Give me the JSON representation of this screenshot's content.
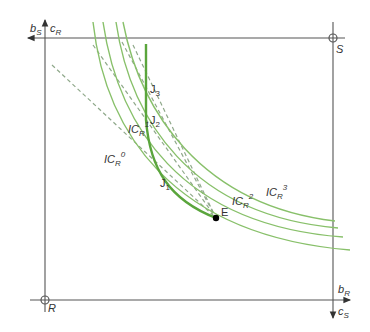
{
  "diagram": {
    "type": "edgeworth-box",
    "colors": {
      "axis": "#555555",
      "indifference_curve": "#88c06a",
      "contract_curve": "#5aa53c",
      "budget_line": "#8fa88a",
      "point": "#000000"
    },
    "origins": {
      "top_right": {
        "label": "S"
      },
      "bottom_left": {
        "label": "R"
      }
    },
    "axis_labels": {
      "top_left_horizontal": {
        "base": "b",
        "sub": "S"
      },
      "top_left_vertical": {
        "base": "c",
        "sub": "R"
      },
      "bottom_right_horizontal": {
        "base": "b",
        "sub": "R"
      },
      "bottom_right_vertical": {
        "base": "c",
        "sub": "S"
      }
    },
    "indifference_curves": [
      {
        "base": "IC",
        "sub": "R",
        "sup": "0"
      },
      {
        "base": "IC",
        "sub": "R",
        "sup": "1"
      },
      {
        "base": "IC",
        "sub": "R",
        "sup": "2"
      },
      {
        "base": "IC",
        "sub": "R",
        "sup": "3"
      }
    ],
    "points": [
      {
        "label": "E"
      },
      {
        "base": "J",
        "sub": "1"
      },
      {
        "base": "J",
        "sub": "2"
      },
      {
        "base": "J",
        "sub": "3"
      }
    ]
  }
}
